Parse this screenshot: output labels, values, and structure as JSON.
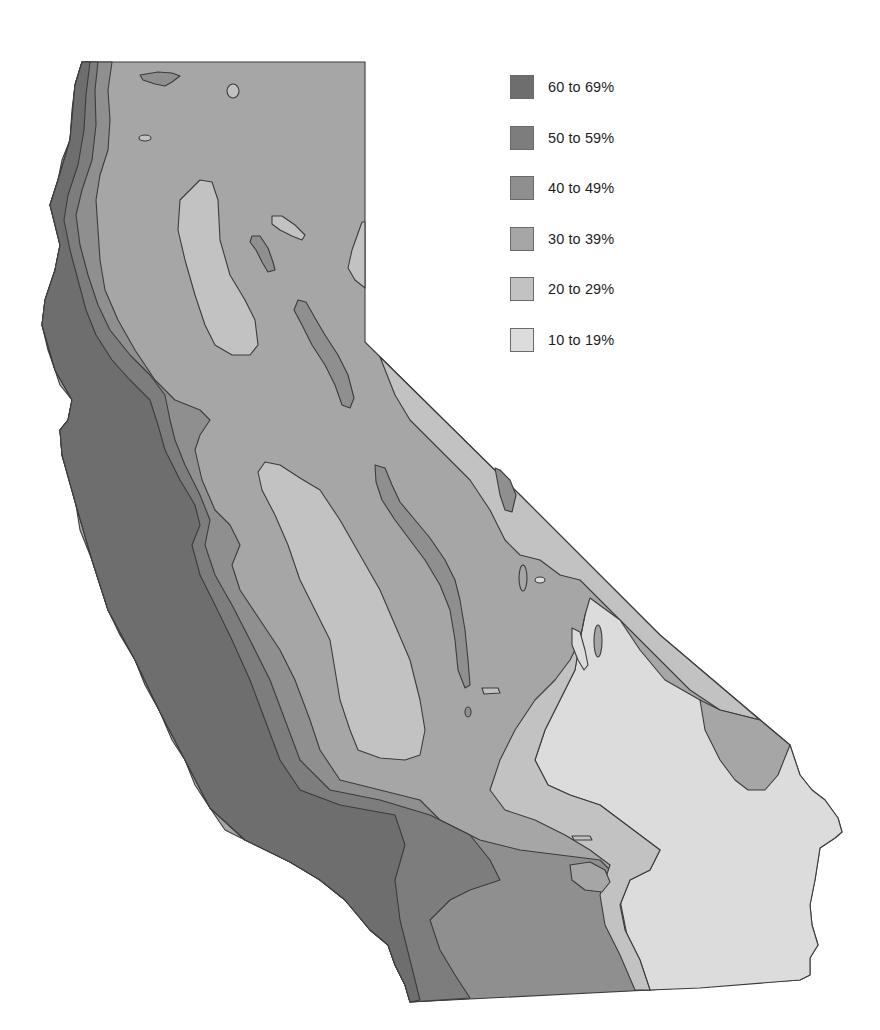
{
  "map": {
    "region": "California",
    "type": "choropleth contour map",
    "colors": {
      "z60_69": "#6e6e6e",
      "z50_59": "#7d7d7d",
      "z40_49": "#8f8f8f",
      "z30_39": "#a6a6a6",
      "z20_29": "#c2c2c2",
      "z10_19": "#dcdcdc",
      "outline": "#3c3c3c"
    }
  },
  "legend": {
    "items": [
      {
        "label": "60 to 69%",
        "color": "#6e6e6e"
      },
      {
        "label": "50 to 59%",
        "color": "#7d7d7d"
      },
      {
        "label": "40 to 49%",
        "color": "#8f8f8f"
      },
      {
        "label": "30 to 39%",
        "color": "#a6a6a6"
      },
      {
        "label": "20 to 29%",
        "color": "#c2c2c2"
      },
      {
        "label": "10 to 19%",
        "color": "#dcdcdc"
      }
    ]
  }
}
